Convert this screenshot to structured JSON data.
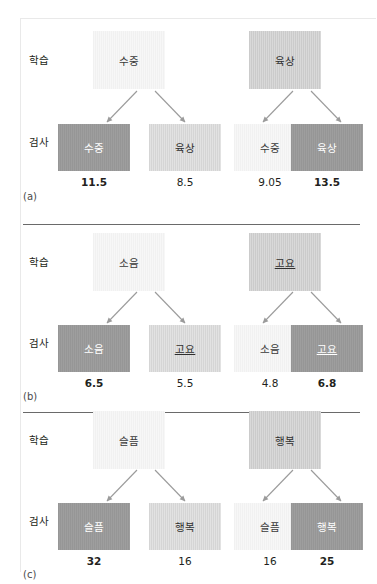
{
  "figure": {
    "row_labels": {
      "study": "학습",
      "test": "검사"
    },
    "colors": {
      "very_light": "#f4f4f4",
      "light": "#dcdcdc",
      "mid": "#d2d2d2",
      "dark": "#9a9a9a",
      "text": "#231f20",
      "divider": "#6a6a6a"
    }
  },
  "panels": [
    {
      "letter": "(a)",
      "study": [
        {
          "label": "수중",
          "shade": "very_light"
        },
        {
          "label": "육상",
          "shade": "mid"
        }
      ],
      "test": [
        {
          "label": "수중",
          "shade": "dark",
          "score": "11.5",
          "match": true
        },
        {
          "label": "육상",
          "shade": "light",
          "score": "8.5",
          "match": false
        },
        {
          "label": "수중",
          "shade": "very_light",
          "score": "9.05",
          "match": false
        },
        {
          "label": "육상",
          "shade": "dark",
          "score": "13.5",
          "match": true
        }
      ]
    },
    {
      "letter": "(b)",
      "study": [
        {
          "label": "소음",
          "shade": "very_light"
        },
        {
          "label": "고요",
          "shade": "mid",
          "underline": true
        }
      ],
      "test": [
        {
          "label": "소음",
          "shade": "dark",
          "score": "6.5",
          "match": true
        },
        {
          "label": "고요",
          "shade": "light",
          "score": "5.5",
          "match": false,
          "underline": true
        },
        {
          "label": "소음",
          "shade": "very_light",
          "score": "4.8",
          "match": false
        },
        {
          "label": "고요",
          "shade": "dark",
          "score": "6.8",
          "match": true,
          "underline": true
        }
      ]
    },
    {
      "letter": "(c)",
      "study": [
        {
          "label": "슬픔",
          "shade": "very_light"
        },
        {
          "label": "행복",
          "shade": "mid"
        }
      ],
      "test": [
        {
          "label": "슬픔",
          "shade": "dark",
          "score": "32",
          "match": true
        },
        {
          "label": "행복",
          "shade": "light",
          "score": "16",
          "match": false
        },
        {
          "label": "슬픔",
          "shade": "very_light",
          "score": "16",
          "match": false
        },
        {
          "label": "행복",
          "shade": "dark",
          "score": "25",
          "match": true
        }
      ]
    }
  ]
}
